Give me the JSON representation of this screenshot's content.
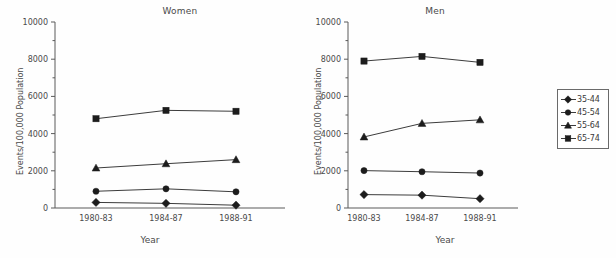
{
  "chart_data": {
    "type": "line",
    "title": "",
    "panels": [
      {
        "title": "Women",
        "xlabel": "Year",
        "ylabel": "Events/100,000 Population",
        "categories": [
          "1980-83",
          "1984-87",
          "1988-91"
        ],
        "ylim": [
          0,
          10000
        ],
        "yticks": [
          0,
          2000,
          4000,
          6000,
          8000,
          10000
        ],
        "ytick_labels": [
          "0",
          "2000",
          "4000",
          "6000",
          "8000",
          "10000"
        ],
        "grid": false,
        "series": [
          {
            "name": "35-44",
            "marker": "diamond",
            "values": [
              300,
              250,
              150
            ]
          },
          {
            "name": "45-54",
            "marker": "circle",
            "values": [
              900,
              1030,
              870
            ]
          },
          {
            "name": "55-64",
            "marker": "triangle",
            "values": [
              2150,
              2380,
              2600
            ]
          },
          {
            "name": "65-74",
            "marker": "square",
            "values": [
              4800,
              5250,
              5200
            ]
          }
        ]
      },
      {
        "title": "Men",
        "xlabel": "Year",
        "ylabel": "Events/100,000 Population",
        "categories": [
          "1980-83",
          "1984-87",
          "1988-91"
        ],
        "ylim": [
          0,
          10000
        ],
        "yticks": [
          0,
          2000,
          4000,
          6000,
          8000,
          10000
        ],
        "ytick_labels": [
          "0",
          "2000",
          "4000",
          "6000",
          "8000",
          "10000"
        ],
        "grid": false,
        "series": [
          {
            "name": "35-44",
            "marker": "diamond",
            "values": [
              720,
              690,
              500
            ]
          },
          {
            "name": "45-54",
            "marker": "circle",
            "values": [
              2010,
              1950,
              1880
            ]
          },
          {
            "name": "55-64",
            "marker": "triangle",
            "values": [
              3820,
              4550,
              4740
            ]
          },
          {
            "name": "65-74",
            "marker": "square",
            "values": [
              7900,
              8150,
              7830
            ]
          }
        ]
      }
    ],
    "legend": {
      "position": "right",
      "entries": [
        {
          "label": "35-44",
          "marker": "diamond"
        },
        {
          "label": "45-54",
          "marker": "circle"
        },
        {
          "label": "55-64",
          "marker": "triangle"
        },
        {
          "label": "65-74",
          "marker": "square"
        }
      ]
    },
    "colors": {
      "line": "#3c3c3c",
      "marker": "#1c1c1c",
      "axis": "#5a5a5a",
      "text": "#3a3a3a",
      "background": "#fefefe"
    }
  }
}
